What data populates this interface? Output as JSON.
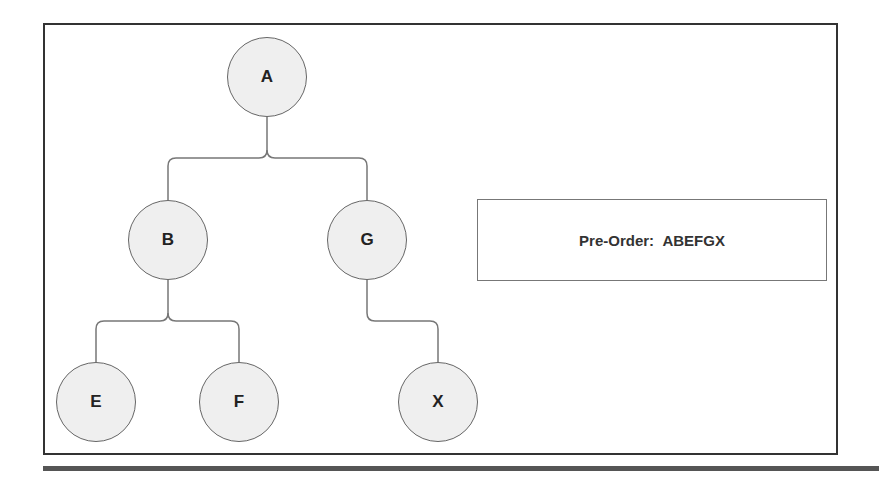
{
  "diagram": {
    "nodes": [
      {
        "id": "A",
        "label": "A",
        "x": 267,
        "y": 77
      },
      {
        "id": "B",
        "label": "B",
        "x": 168,
        "y": 240
      },
      {
        "id": "G",
        "label": "G",
        "x": 367,
        "y": 240
      },
      {
        "id": "E",
        "label": "E",
        "x": 96,
        "y": 402
      },
      {
        "id": "F",
        "label": "F",
        "x": 239,
        "y": 402
      },
      {
        "id": "X",
        "label": "X",
        "x": 438,
        "y": 402
      }
    ],
    "edges": [
      {
        "from": "A",
        "to": "B"
      },
      {
        "from": "A",
        "to": "G"
      },
      {
        "from": "B",
        "to": "E"
      },
      {
        "from": "B",
        "to": "F"
      },
      {
        "from": "G",
        "to": "X"
      }
    ],
    "result": {
      "label": "Pre-Order:",
      "value": "ABEFGX",
      "text": "Pre-Order:  ABEFGX"
    }
  }
}
